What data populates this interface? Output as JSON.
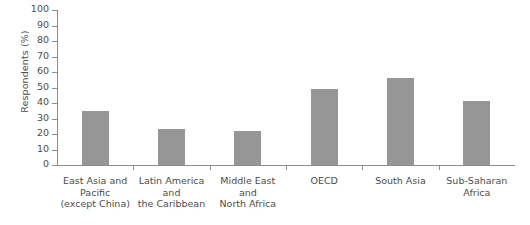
{
  "chart_data": {
    "type": "bar",
    "title": "",
    "xlabel": "",
    "ylabel": "Respondents (%)",
    "ylim": [
      0,
      100
    ],
    "ytick_step": 10,
    "yticks": [
      100,
      90,
      80,
      70,
      60,
      50,
      40,
      30,
      20,
      10,
      0
    ],
    "grid": false,
    "legend": "none",
    "bar_color": "#969696",
    "axis_color": "#8c8c8c",
    "text_color": "#4d4d4d",
    "categories": [
      "East Asia and Pacific (except China)",
      "Latin America and the Caribbean",
      "Middle East and North Africa",
      "OECD",
      "South Asia",
      "Sub-Saharan Africa"
    ],
    "category_lines": [
      [
        "East Asia and",
        "Pacific",
        "(except China)"
      ],
      [
        "Latin America",
        "and",
        "the Caribbean"
      ],
      [
        "Middle East",
        "and",
        "North Africa"
      ],
      [
        "OECD"
      ],
      [
        "South Asia"
      ],
      [
        "Sub-Saharan",
        "Africa"
      ]
    ],
    "values": [
      35,
      23,
      22,
      49,
      56,
      41
    ]
  }
}
